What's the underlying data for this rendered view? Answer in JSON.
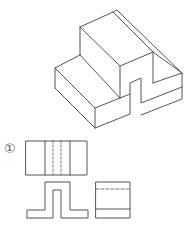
{
  "figure": {
    "option_label": "①",
    "stroke_color": "#555555",
    "hidden_line_color": "#777777",
    "background": "#ffffff"
  },
  "isometric_view": {
    "description": "Isometric drawing of stepped block with U-shaped notch on right face"
  },
  "orthographic_views": {
    "top_view": {
      "description": "Rectangle with two solid vertical lines and two dashed hidden lines"
    },
    "front_view": {
      "description": "Inverted-U profile with base flanges and center slot"
    },
    "side_view": {
      "description": "Rectangle with dashed hidden line near top and solid line near bottom"
    }
  }
}
